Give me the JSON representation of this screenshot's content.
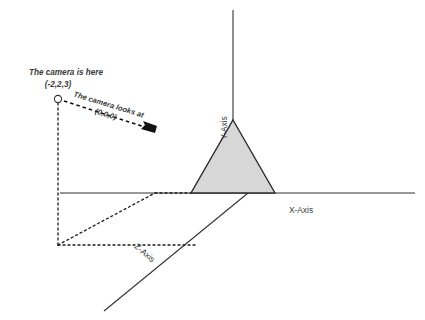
{
  "diagram": {
    "background_color": "#ffffff"
  },
  "axes": {
    "x": {
      "label": "X-Axis",
      "label_x": 301,
      "label_y": 213,
      "line": {
        "x1": 60,
        "y1": 193,
        "x2": 415,
        "y2": 193
      }
    },
    "y": {
      "label": "Y-Axis",
      "label_x": 227,
      "label_y": 128,
      "rotation": -90,
      "line": {
        "x1": 233,
        "y1": 10,
        "x2": 233,
        "y2": 193
      }
    },
    "z": {
      "label": "Z-Axis",
      "label_x": 143,
      "label_y": 255,
      "rotation": 41,
      "line": {
        "x1": 248,
        "y1": 193,
        "x2": 104,
        "y2": 311
      }
    }
  },
  "camera": {
    "position_label": "The camera is here",
    "position_value": "(-2,2,3)",
    "position_label_x": 66,
    "position_label_y": 75,
    "position_value_x": 54,
    "position_value_y": 87,
    "marker_x": 58,
    "marker_y": 99,
    "marker_r": 3.6
  },
  "look_at": {
    "label_line1": "The camera looks at",
    "label_line2": "(0,0,0)",
    "label_x": 108,
    "label_y": 107,
    "rotation": 27,
    "arrow": {
      "x1": 64,
      "y1": 101,
      "x2": 152,
      "y2": 130
    }
  },
  "object": {
    "name": "triangle-object",
    "fill_color": "#d7d7d7",
    "stroke_color": "#2b2b2b",
    "points": "233,120 275,193 191,193"
  },
  "projection_lines": {
    "vertical": {
      "x1": 58,
      "y1": 103,
      "x2": 58,
      "y2": 245
    },
    "base_horizontal": {
      "x1": 58,
      "y1": 245,
      "x2": 192,
      "y2": 245
    },
    "diagonal": {
      "x1": 58,
      "y1": 245,
      "x2": 155,
      "y2": 193
    },
    "top_horizontal": {
      "x1": 155,
      "y1": 193,
      "x2": 191,
      "y2": 193
    }
  },
  "colors": {
    "line": "#333333",
    "text": "#3a3a3a",
    "fill": "#d7d7d7"
  }
}
